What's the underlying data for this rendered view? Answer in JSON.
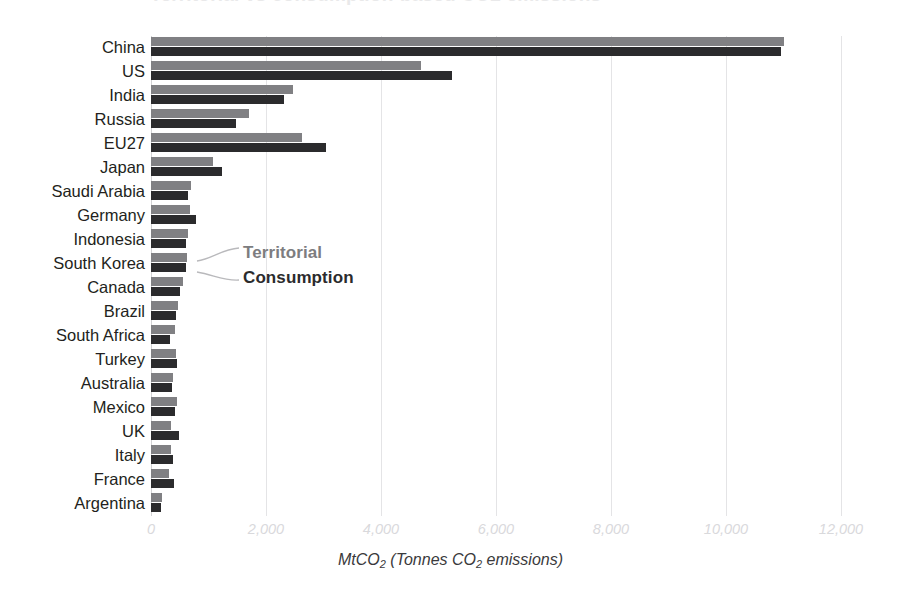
{
  "title": "Territorial vs consumption-based CO2 emissions",
  "chart_data": {
    "type": "bar",
    "orientation": "horizontal",
    "title": "Territorial vs consumption-based CO2 emissions",
    "xlabel": "MtCO2 (Tonnes CO2 emissions)",
    "ylabel": "",
    "xlim": [
      0,
      12000
    ],
    "grid": true,
    "grid_axis": "x",
    "legend_position": "callout-inside-plot",
    "categories": [
      "China",
      "US",
      "India",
      "Russia",
      "EU27",
      "Japan",
      "Saudi Arabia",
      "Germany",
      "Indonesia",
      "South Korea",
      "Canada",
      "Brazil",
      "South Africa",
      "Turkey",
      "Australia",
      "Mexico",
      "UK",
      "Italy",
      "France",
      "Argentina"
    ],
    "series": [
      {
        "name": "Territorial",
        "color": "#808083",
        "values": [
          11000,
          4700,
          2470,
          1700,
          2630,
          1080,
          690,
          680,
          650,
          620,
          560,
          470,
          410,
          430,
          390,
          450,
          350,
          350,
          310,
          190
        ]
      },
      {
        "name": "Consumption",
        "color": "#2b2b2d",
        "values": [
          10950,
          5230,
          2320,
          1480,
          3050,
          1230,
          640,
          790,
          600,
          600,
          510,
          440,
          330,
          450,
          360,
          420,
          480,
          390,
          400,
          180
        ]
      }
    ],
    "xticks": [
      {
        "value": 0,
        "label": "0"
      },
      {
        "value": 2000,
        "label": "2,000"
      },
      {
        "value": 4000,
        "label": "4,000"
      },
      {
        "value": 6000,
        "label": "6,000"
      },
      {
        "value": 8000,
        "label": "8,000"
      },
      {
        "value": 10000,
        "label": "10,000"
      },
      {
        "value": 12000,
        "label": "12,000"
      }
    ],
    "axis_label_parts": {
      "prefix": "MtCO",
      "sub1": "2",
      "middle": " (Tonnes CO",
      "sub2": "2",
      "suffix": " emissions)"
    }
  },
  "legend": {
    "territorial": "Territorial",
    "consumption": "Consumption"
  },
  "colors": {
    "territorial": "#808083",
    "consumption": "#2b2b2d",
    "gridline": "#e4e4e6",
    "axis_line": "#d2d2d4",
    "tick_text": "#d9d9dc",
    "label_text": "#231f20",
    "background": "#ffffff"
  }
}
